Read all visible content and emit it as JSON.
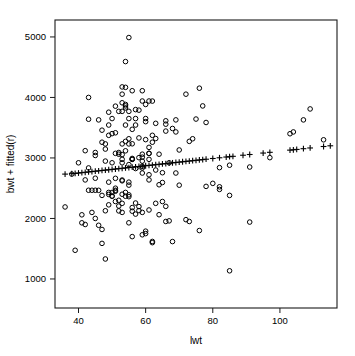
{
  "chart_data": {
    "type": "scatter",
    "title": "",
    "subtitle": "",
    "xlabel": "lwt",
    "ylabel": "bwt + fitted(r)",
    "grid": false,
    "legend": "none",
    "xlim": [
      33,
      117
    ],
    "ylim": [
      520,
      5280
    ],
    "xticks": [
      40,
      60,
      80,
      100
    ],
    "yticks": [
      1000,
      2000,
      3000,
      4000,
      5000
    ],
    "xtick_labels": [
      "40",
      "60",
      "80",
      "100"
    ],
    "ytick_labels": [
      "1000",
      "2000",
      "3000",
      "4000",
      "5000"
    ],
    "series": [
      {
        "name": "observed",
        "marker": "circle",
        "color": "#000000",
        "points": [
          [
            82,
            2523
          ],
          [
            55,
            2551
          ],
          [
            64,
            2557
          ],
          [
            65,
            2594
          ],
          [
            55,
            2600
          ],
          [
            53,
            2622
          ],
          [
            42,
            2637
          ],
          [
            61,
            2637
          ],
          [
            51,
            2663
          ],
          [
            45,
            2665
          ],
          [
            61,
            2722
          ],
          [
            38,
            2733
          ],
          [
            69,
            2751
          ],
          [
            59,
            2751
          ],
          [
            65,
            2756
          ],
          [
            63,
            2800
          ],
          [
            57,
            2825
          ],
          [
            59,
            2835
          ],
          [
            82,
            2840
          ],
          [
            59,
            2863
          ],
          [
            85,
            2880
          ],
          [
            55,
            2890
          ],
          [
            67,
            2920
          ],
          [
            53,
            2920
          ],
          [
            50,
            2920
          ],
          [
            48,
            2948
          ],
          [
            59,
            2948
          ],
          [
            61,
            2977
          ],
          [
            56,
            2977
          ],
          [
            56,
            2977
          ],
          [
            53,
            2977
          ],
          [
            56,
            2992
          ],
          [
            58,
            3005
          ],
          [
            59,
            3013
          ],
          [
            45,
            3041
          ],
          [
            53,
            3056
          ],
          [
            52,
            3062
          ],
          [
            64,
            3062
          ],
          [
            59,
            3062
          ],
          [
            51,
            3076
          ],
          [
            61,
            3076
          ],
          [
            61,
            3076
          ],
          [
            52,
            3090
          ],
          [
            54,
            3118
          ],
          [
            70,
            3132
          ],
          [
            48,
            3147
          ],
          [
            61,
            3175
          ],
          [
            55,
            3232
          ],
          [
            53,
            3232
          ],
          [
            48,
            3232
          ],
          [
            56,
            3234
          ],
          [
            62,
            3260
          ],
          [
            54,
            3274
          ],
          [
            73,
            3274
          ],
          [
            60,
            3303
          ],
          [
            55,
            3317
          ],
          [
            74,
            3317
          ],
          [
            63,
            3321
          ],
          [
            58,
            3331
          ],
          [
            49,
            3374
          ],
          [
            62,
            3374
          ],
          [
            50,
            3402
          ],
          [
            51,
            3416
          ],
          [
            69,
            3430
          ],
          [
            66,
            3444
          ],
          [
            47,
            3459
          ],
          [
            56,
            3473
          ],
          [
            57,
            3544
          ],
          [
            68,
            3487
          ],
          [
            49,
            3544
          ],
          [
            54,
            3544
          ],
          [
            66,
            3558
          ],
          [
            63,
            3572
          ],
          [
            78,
            3586
          ],
          [
            60,
            3600
          ],
          [
            66,
            3614
          ],
          [
            46,
            3629
          ],
          [
            69,
            3629
          ],
          [
            75,
            3643
          ],
          [
            50,
            3651
          ],
          [
            55,
            3651
          ],
          [
            57,
            3651
          ],
          [
            60,
            3651
          ],
          [
            49,
            3756
          ],
          [
            52,
            3770
          ],
          [
            55,
            3770
          ],
          [
            53,
            3770
          ],
          [
            58,
            3790
          ],
          [
            57,
            3799
          ],
          [
            54,
            3827
          ],
          [
            51,
            3856
          ],
          [
            54,
            3860
          ],
          [
            77,
            3860
          ],
          [
            60,
            3884
          ],
          [
            54,
            3884
          ],
          [
            53,
            3912
          ],
          [
            62,
            3940
          ],
          [
            59,
            3941
          ],
          [
            61,
            3941
          ],
          [
            43,
            4000
          ],
          [
            53,
            4054
          ],
          [
            72,
            4054
          ],
          [
            56,
            4111
          ],
          [
            59,
            4111
          ],
          [
            76,
            4153
          ],
          [
            54,
            4167
          ],
          [
            53,
            4174
          ],
          [
            54,
            4593
          ],
          [
            55,
            4990
          ],
          [
            36,
            2190
          ],
          [
            39,
            1474
          ],
          [
            47,
            1588
          ],
          [
            41,
            2060
          ],
          [
            41,
            1928
          ],
          [
            42,
            1900
          ],
          [
            43,
            2466
          ],
          [
            44,
            2466
          ],
          [
            45,
            2466
          ],
          [
            46,
            2465
          ],
          [
            45,
            2000
          ],
          [
            47,
            1818
          ],
          [
            48,
            1330
          ],
          [
            48,
            2127
          ],
          [
            49,
            2225
          ],
          [
            49,
            2430
          ],
          [
            50,
            2430
          ],
          [
            50,
            2368
          ],
          [
            50,
            2370
          ],
          [
            51,
            2450
          ],
          [
            51,
            2280
          ],
          [
            52,
            2205
          ],
          [
            52,
            2300
          ],
          [
            52,
            2125
          ],
          [
            53,
            2100
          ],
          [
            53,
            2400
          ],
          [
            53,
            2250
          ],
          [
            54,
            2430
          ],
          [
            54,
            2367
          ],
          [
            55,
            2360
          ],
          [
            55,
            2390
          ],
          [
            55,
            1928
          ],
          [
            56,
            2180
          ],
          [
            56,
            2120
          ],
          [
            57,
            2255
          ],
          [
            57,
            2072
          ],
          [
            58,
            2130
          ],
          [
            58,
            2196
          ],
          [
            59,
            2100
          ],
          [
            59,
            1730
          ],
          [
            60,
            1790
          ],
          [
            61,
            2140
          ],
          [
            62,
            1600
          ],
          [
            63,
            2250
          ],
          [
            64,
            2062
          ],
          [
            65,
            2280
          ],
          [
            66,
            1950
          ],
          [
            67,
            1960
          ],
          [
            68,
            1618
          ],
          [
            70,
            2550
          ],
          [
            72,
            1980
          ],
          [
            73,
            1950
          ],
          [
            76,
            1800
          ],
          [
            78,
            2530
          ],
          [
            80,
            2580
          ],
          [
            82,
            2480
          ],
          [
            85,
            1135
          ],
          [
            85,
            2381
          ],
          [
            91,
            1940
          ],
          [
            91,
            2850
          ],
          [
            97,
            3005
          ],
          [
            103,
            3400
          ],
          [
            104,
            3430
          ],
          [
            107,
            3629
          ],
          [
            109,
            3810
          ],
          [
            113,
            3300
          ],
          [
            44,
            2100
          ],
          [
            46,
            1887
          ],
          [
            47,
            2381
          ],
          [
            49,
            2397
          ],
          [
            51,
            2466
          ],
          [
            53,
            2635
          ],
          [
            43,
            3640
          ],
          [
            43,
            2835
          ],
          [
            45,
            3090
          ],
          [
            47,
            3260
          ],
          [
            49,
            2600
          ],
          [
            51,
            2500
          ],
          [
            42,
            3120
          ],
          [
            40,
            2920
          ],
          [
            56,
            1700
          ],
          [
            60,
            1750
          ],
          [
            62,
            1620
          ],
          [
            66,
            2200
          ]
        ]
      },
      {
        "name": "fitted",
        "marker": "plus",
        "color": "#000000",
        "points": [
          [
            36,
            2733
          ],
          [
            38,
            2740
          ],
          [
            39,
            2745
          ],
          [
            40,
            2751
          ],
          [
            41,
            2757
          ],
          [
            42,
            2763
          ],
          [
            43,
            2769
          ],
          [
            44,
            2775
          ],
          [
            45,
            2781
          ],
          [
            46,
            2787
          ],
          [
            47,
            2793
          ],
          [
            48,
            2799
          ],
          [
            49,
            2805
          ],
          [
            50,
            2811
          ],
          [
            51,
            2817
          ],
          [
            52,
            2823
          ],
          [
            53,
            2829
          ],
          [
            54,
            2835
          ],
          [
            55,
            2841
          ],
          [
            56,
            2847
          ],
          [
            57,
            2853
          ],
          [
            58,
            2859
          ],
          [
            59,
            2865
          ],
          [
            60,
            2871
          ],
          [
            61,
            2877
          ],
          [
            62,
            2883
          ],
          [
            63,
            2889
          ],
          [
            64,
            2895
          ],
          [
            65,
            2901
          ],
          [
            66,
            2907
          ],
          [
            67,
            2913
          ],
          [
            68,
            2919
          ],
          [
            69,
            2925
          ],
          [
            70,
            2931
          ],
          [
            71,
            2937
          ],
          [
            72,
            2943
          ],
          [
            73,
            2949
          ],
          [
            74,
            2955
          ],
          [
            75,
            2961
          ],
          [
            76,
            2967
          ],
          [
            77,
            2973
          ],
          [
            78,
            2979
          ],
          [
            80,
            2991
          ],
          [
            82,
            3003
          ],
          [
            84,
            3015
          ],
          [
            85,
            3021
          ],
          [
            86,
            3027
          ],
          [
            89,
            3045
          ],
          [
            91,
            3057
          ],
          [
            95,
            3081
          ],
          [
            97,
            3093
          ],
          [
            103,
            3129
          ],
          [
            104,
            3135
          ],
          [
            105,
            3141
          ],
          [
            107,
            3153
          ],
          [
            109,
            3165
          ],
          [
            113,
            3189
          ],
          [
            115,
            3201
          ]
        ]
      }
    ]
  },
  "axes": {
    "y_label": "bwt + fitted(r)",
    "x_label": "lwt"
  }
}
